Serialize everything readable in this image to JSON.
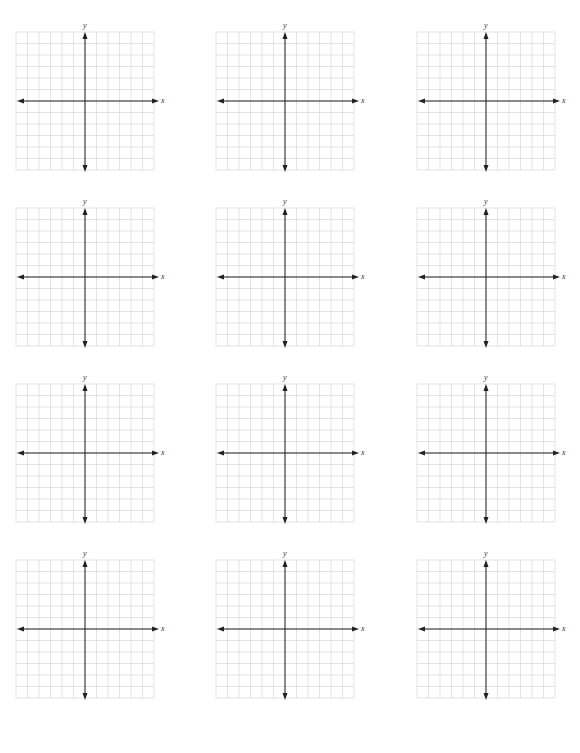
{
  "page": {
    "title": "",
    "background": "#ffffff"
  },
  "layout": {
    "rows": 4,
    "cols": 3,
    "grid_cells": 12,
    "cell_size_px": 11.5,
    "col_x": [
      16,
      216,
      417
    ],
    "row_y": [
      32,
      208,
      384,
      560
    ]
  },
  "colors": {
    "grid_line": "#dcdcdc",
    "axis": "#222222",
    "label": "#333333"
  },
  "graphs": [
    {
      "x_label": "x",
      "y_label": "y"
    },
    {
      "x_label": "x",
      "y_label": "y"
    },
    {
      "x_label": "x",
      "y_label": "y"
    },
    {
      "x_label": "x",
      "y_label": "y"
    },
    {
      "x_label": "x",
      "y_label": "y"
    },
    {
      "x_label": "x",
      "y_label": "y"
    },
    {
      "x_label": "x",
      "y_label": "y"
    },
    {
      "x_label": "x",
      "y_label": "y"
    },
    {
      "x_label": "x",
      "y_label": "y"
    },
    {
      "x_label": "x",
      "y_label": "y"
    },
    {
      "x_label": "x",
      "y_label": "y"
    },
    {
      "x_label": "x",
      "y_label": "y"
    }
  ]
}
